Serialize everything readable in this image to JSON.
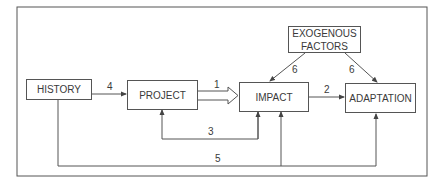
{
  "diagram": {
    "nodes": {
      "history": "HISTORY",
      "project": "PROJECT",
      "impact": "IMPACT",
      "adaptation": "ADAPTATION",
      "exogenous_line1": "EXOGENOUS",
      "exogenous_line2": "FACTORS"
    },
    "edges": [
      {
        "from": "HISTORY",
        "to": "PROJECT",
        "label": "4"
      },
      {
        "from": "PROJECT",
        "to": "IMPACT",
        "label": "1",
        "style": "hollow-double-arrow"
      },
      {
        "from": "IMPACT",
        "to": "ADAPTATION",
        "label": "2"
      },
      {
        "from": "IMPACT",
        "to": "PROJECT",
        "label": "3"
      },
      {
        "from": "HISTORY",
        "to": "IMPACT, ADAPTATION",
        "label": "5"
      },
      {
        "from": "EXOGENOUS FACTORS",
        "to": "IMPACT",
        "label": "6"
      },
      {
        "from": "EXOGENOUS FACTORS",
        "to": "ADAPTATION",
        "label": "6"
      }
    ],
    "edge_labels": {
      "e1": "1",
      "e2": "2",
      "e3": "3",
      "e4": "4",
      "e5": "5",
      "e6a": "6",
      "e6b": "6"
    }
  }
}
